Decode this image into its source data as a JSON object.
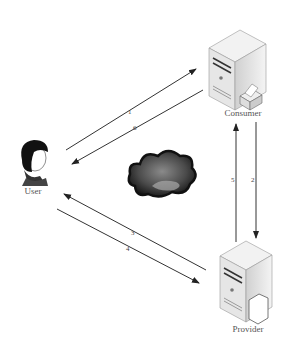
{
  "diagram": {
    "nodes": [
      {
        "id": "user",
        "label": "User",
        "icon": "person-icon"
      },
      {
        "id": "consumer",
        "label": "Consumer",
        "icon": "server-printer-icon"
      },
      {
        "id": "provider",
        "label": "Provider",
        "icon": "server-document-icon"
      },
      {
        "id": "cloud",
        "label": "",
        "icon": "cloud-icon"
      }
    ],
    "edges": [
      {
        "label": "1",
        "from": "User",
        "to": "Consumer"
      },
      {
        "label": "2",
        "from": "Consumer",
        "to": "Provider"
      },
      {
        "label": "3",
        "from": "Provider",
        "to": "User"
      },
      {
        "label": "4",
        "from": "User",
        "to": "Provider"
      },
      {
        "label": "5",
        "from": "Provider",
        "to": "Consumer"
      },
      {
        "label": "6",
        "from": "Consumer",
        "to": "User"
      }
    ],
    "colors": {
      "line": "#333333",
      "cloud": "#2a2a2a",
      "server": "#e8e8e8"
    }
  }
}
